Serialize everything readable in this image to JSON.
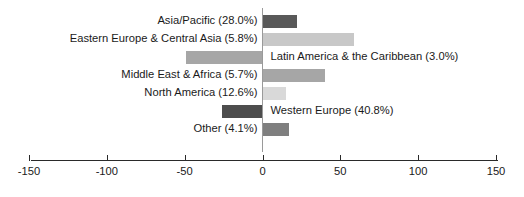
{
  "chart_data": {
    "type": "bar",
    "orientation": "horizontal",
    "title": "",
    "subtitle": "",
    "xlabel": "",
    "ylabel": "",
    "xlim": [
      -150,
      150
    ],
    "grid": false,
    "legend": "none",
    "zero_line": true,
    "xticks": [
      {
        "value": -150,
        "label": "-150"
      },
      {
        "value": -100,
        "label": "-100"
      },
      {
        "value": -50,
        "label": "-50"
      },
      {
        "value": 0,
        "label": "0"
      },
      {
        "value": 50,
        "label": "50"
      },
      {
        "value": 100,
        "label": "100"
      },
      {
        "value": 150,
        "label": "150"
      }
    ],
    "categories": [
      "Asia/Pacific",
      "Eastern Europe & Central Asia",
      "Latin America & the Caribbean",
      "Middle East & Africa",
      "North America",
      "Western Europe",
      "Other"
    ],
    "values": [
      22,
      59,
      -49,
      40,
      15,
      -26,
      17
    ],
    "bars": [
      {
        "label": "Asia/Pacific (28.0%)",
        "category": "Asia/Pacific",
        "percent": "28.0%",
        "value": 22,
        "color": "#595959",
        "label_side": "left"
      },
      {
        "label": "Eastern Europe & Central Asia (5.8%)",
        "category": "Eastern Europe & Central Asia",
        "percent": "5.8%",
        "value": 59,
        "color": "#c8c8c8",
        "label_side": "left"
      },
      {
        "label": "Latin America & the Caribbean (3.0%)",
        "category": "Latin America & the Caribbean",
        "percent": "3.0%",
        "value": -49,
        "color": "#a6a6a6",
        "label_side": "right"
      },
      {
        "label": "Middle East & Africa (5.7%)",
        "category": "Middle East & Africa",
        "percent": "5.7%",
        "value": 40,
        "color": "#a6a6a6",
        "label_side": "left"
      },
      {
        "label": "North America (12.6%)",
        "category": "North America",
        "percent": "12.6%",
        "value": 15,
        "color": "#d9d9d9",
        "label_side": "left"
      },
      {
        "label": "Western Europe (40.8%)",
        "category": "Western Europe",
        "percent": "40.8%",
        "value": -26,
        "color": "#4d4d4d",
        "label_side": "right"
      },
      {
        "label": "Other (4.1%)",
        "category": "Other",
        "percent": "4.1%",
        "value": 17,
        "color": "#7f7f7f",
        "label_side": "left"
      }
    ]
  }
}
